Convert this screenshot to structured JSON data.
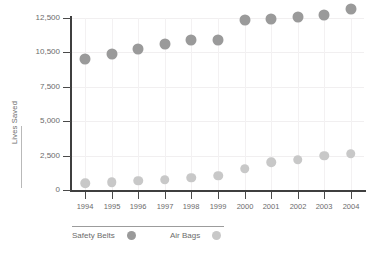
{
  "chart_data": {
    "type": "scatter",
    "title": "",
    "subtitle": "",
    "xlabel": "",
    "ylabel": "Lives Saved",
    "categories": [
      "1994",
      "1995",
      "1996",
      "1997",
      "1998",
      "1999",
      "2000",
      "2001",
      "2002",
      "2003",
      "2004"
    ],
    "y_ticks": [
      0,
      2500,
      5000,
      7500,
      10500,
      12500
    ],
    "y_tick_labels": [
      "0",
      "2,500",
      "5,000",
      "7,500",
      "10,500",
      "12,500"
    ],
    "ylim": [
      0,
      13500
    ],
    "grid": true,
    "legend_position": "bottom-left",
    "series": [
      {
        "name": "Safety Belts",
        "color": "#9a9a9a",
        "values": [
          9900,
          10400,
          10700,
          11000,
          11200,
          11200,
          12400,
          12450,
          12550,
          12700,
          13000
        ]
      },
      {
        "name": "Air Bags",
        "color": "#c8c8c8",
        "values": [
          500,
          560,
          670,
          740,
          880,
          1020,
          1540,
          2000,
          2200,
          2480,
          2640
        ]
      }
    ]
  },
  "colors": {
    "safety_belts": "#9a9a9a",
    "air_bags": "#c8c8c8",
    "axis": "#3f3f3f",
    "grid": "#f1eff0",
    "text": "#6b6b6b",
    "background": "#ffffff"
  },
  "legend": {
    "items": [
      {
        "label": "Safety Belts",
        "color": "#9a9a9a"
      },
      {
        "label": "Air Bags",
        "color": "#c8c8c8"
      }
    ]
  }
}
